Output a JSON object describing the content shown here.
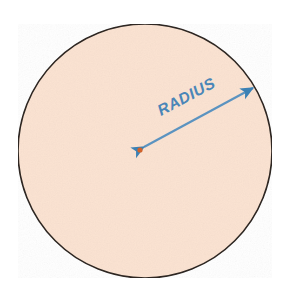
{
  "figure": {
    "background_color": "#ffffff"
  },
  "circle": {
    "name": "circle",
    "center_x": 145,
    "center_y": 151,
    "radius": 127,
    "fill_color": "#fbe3d2",
    "stroke_color": "#2e2722",
    "stroke_width": 1.6
  },
  "center_point": {
    "name": "center-point",
    "x": 140,
    "y": 150,
    "radius": 2.6,
    "color": "#d2622a"
  },
  "radius_arrow": {
    "name": "radius-arrow",
    "label": "RADIUS",
    "color": "#5b93c0",
    "head_color": "#3c81b4",
    "line_width": 2.2,
    "start_x": 144,
    "start_y": 147,
    "end_x": 253,
    "end_y": 88,
    "angle_degrees": -28,
    "double_headed": true,
    "label_x": 161,
    "label_y": 116,
    "label_color": "#4a86b8",
    "label_font_size": 15.5
  }
}
